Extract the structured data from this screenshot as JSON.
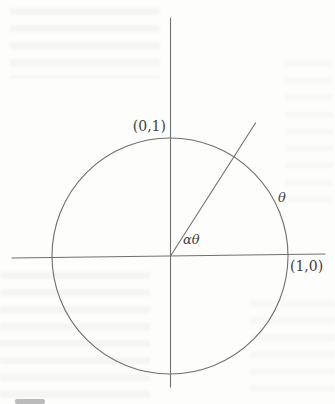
{
  "figure": {
    "labels": {
      "top_point": "(0,1)",
      "right_point": "(1,0)",
      "arc_angle": "θ",
      "ray_angle": "αθ"
    },
    "colors": {
      "line": "#6f6f6f",
      "text": "#3f3f3f",
      "background": "#fdfdfc"
    }
  }
}
